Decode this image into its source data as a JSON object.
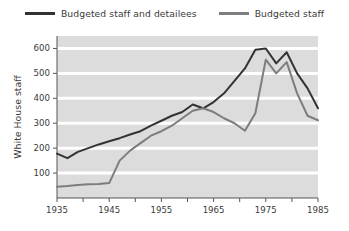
{
  "legend": {
    "position": "top-center",
    "items": [
      {
        "label": "Budgeted staff and detailees",
        "color": "#333333",
        "key": "budgeted_staff_and_detailees"
      },
      {
        "label": "Budgeted staff",
        "color": "#7d7d7d",
        "key": "budgeted_staff"
      }
    ]
  },
  "chart_data": {
    "type": "line",
    "title": "",
    "subtitle": "",
    "xlabel": "",
    "ylabel": "White House staff",
    "xlim": [
      1935,
      1985
    ],
    "ylim": [
      0,
      650
    ],
    "grid": "horizontal-white-bands",
    "legend_position": "top-center",
    "x_tick_labels": [
      "1935",
      "",
      "1945",
      "",
      "1955",
      "",
      "1965",
      "",
      "1975",
      "",
      "1985"
    ],
    "x_ticks": [
      1935,
      1940,
      1945,
      1950,
      1955,
      1960,
      1965,
      1970,
      1975,
      1980,
      1985
    ],
    "y_ticks": [
      100,
      200,
      300,
      400,
      500,
      600
    ],
    "y_tick_labels": [
      "100",
      "200",
      "300",
      "400",
      "500",
      "600"
    ],
    "x": [
      1935,
      1937,
      1939,
      1941,
      1943,
      1945,
      1947,
      1949,
      1951,
      1953,
      1955,
      1957,
      1959,
      1961,
      1963,
      1965,
      1967,
      1969,
      1971,
      1973,
      1975,
      1977,
      1979,
      1981,
      1983,
      1985
    ],
    "series": [
      {
        "name": "Budgeted staff and detailees",
        "color": "#333333",
        "values": [
          178,
          160,
          185,
          200,
          215,
          228,
          240,
          255,
          268,
          290,
          310,
          330,
          345,
          375,
          360,
          385,
          420,
          470,
          520,
          595,
          600,
          540,
          585,
          500,
          440,
          360
        ]
      },
      {
        "name": "Budgeted staff",
        "color": "#7d7d7d",
        "values": [
          45,
          48,
          52,
          55,
          56,
          60,
          150,
          190,
          220,
          250,
          268,
          290,
          320,
          350,
          360,
          345,
          320,
          300,
          270,
          340,
          555,
          500,
          545,
          420,
          330,
          312
        ]
      }
    ]
  }
}
